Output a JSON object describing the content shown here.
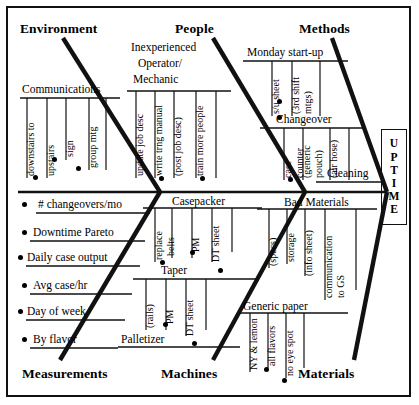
{
  "diagram": {
    "type": "fishbone-ishikawa",
    "effect": "UPTIME",
    "effect_letters": [
      "U",
      "P",
      "T",
      "I",
      "M",
      "E"
    ],
    "categories_top": [
      "Environment",
      "People",
      "Methods"
    ],
    "categories_bottom": [
      "Measurements",
      "Machines",
      "Materials"
    ]
  },
  "headers": {
    "environment": "Environment",
    "people": "People",
    "methods": "Methods",
    "measurements": "Measurements",
    "machines": "Machines",
    "materials": "Materials"
  },
  "environment": {
    "branches": [
      {
        "name": "Communications",
        "causes": [
          "downstairs to",
          "upstairs",
          "sign",
          "group mtg"
        ]
      }
    ]
  },
  "people": {
    "branches": [
      {
        "name": "Inexperienced",
        "name_line2": "Operator/",
        "name_line3": "Mechanic",
        "causes": [
          "update job desc",
          "write trng manual",
          "(post job desc)",
          "train more people"
        ]
      }
    ]
  },
  "methods": {
    "branches": [
      {
        "name": "Monday start-up",
        "causes": [
          "s/u sheet",
          "(3rd shift",
          "mtgs)"
        ]
      },
      {
        "name": "Changeover",
        "causes": [
          "case",
          "counter",
          "(generic",
          "pouch)",
          "(air hose)"
        ]
      },
      {
        "name": "Cleaning",
        "causes": []
      }
    ]
  },
  "measurements": {
    "items": [
      "# changeovers/mo",
      "Downtime Pareto",
      "Daily case output",
      "Avg case/hr",
      "Day of week",
      "By flavor"
    ]
  },
  "machines": {
    "branches": [
      {
        "name": "Casepacker",
        "causes": [
          "replace",
          "belts",
          "PM",
          "DT sheet"
        ]
      },
      {
        "name": "Taper",
        "causes": [
          "(rails)",
          "PM",
          "DT sheet"
        ]
      },
      {
        "name": "Palletizer",
        "causes": []
      }
    ]
  },
  "materials": {
    "branches": [
      {
        "name": "Bad Materials",
        "causes": [
          "(specs)",
          "storage",
          "(info sheet)",
          "communication",
          "to GS"
        ]
      },
      {
        "name": "Generic paper",
        "causes": [
          "NY & lemon",
          "all flavors",
          "no eye spot"
        ]
      }
    ]
  },
  "style": {
    "ink": "#111111",
    "paper": "#ffffff"
  }
}
